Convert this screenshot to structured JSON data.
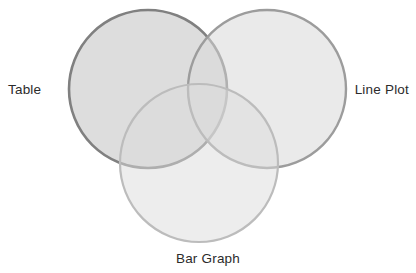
{
  "diagram": {
    "type": "venn-3-circle",
    "background_color": "#ffffff",
    "title": "",
    "label_color": "#2b2b2b",
    "sets": [
      {
        "id": "table",
        "label": "Table",
        "position": "top-left",
        "label_position": "left",
        "cx": 148,
        "cy": 89,
        "r": 79,
        "fill_color": "#d0d0d0",
        "stroke_color": "#808080",
        "stroke_width": 2.6,
        "fill_opacity": 0.72
      },
      {
        "id": "line-plot",
        "label": "Line Plot",
        "position": "top-right",
        "label_position": "right",
        "cx": 267,
        "cy": 89,
        "r": 79,
        "fill_color": "#d8d8d8",
        "stroke_color": "#9c9c9c",
        "stroke_width": 2.4,
        "fill_opacity": 0.55
      },
      {
        "id": "bar-graph",
        "label": "Bar Graph",
        "position": "bottom-center",
        "label_position": "bottom",
        "cx": 199,
        "cy": 163,
        "r": 79,
        "fill_color": "#dcdcdc",
        "stroke_color": "#bcbcbc",
        "stroke_width": 2.2,
        "fill_opacity": 0.5
      }
    ],
    "regions": {
      "table_only": "",
      "line_plot_only": "",
      "bar_graph_only": "",
      "table_line_plot": "",
      "table_bar_graph": "",
      "line_plot_bar_graph": "",
      "all_three": ""
    }
  }
}
